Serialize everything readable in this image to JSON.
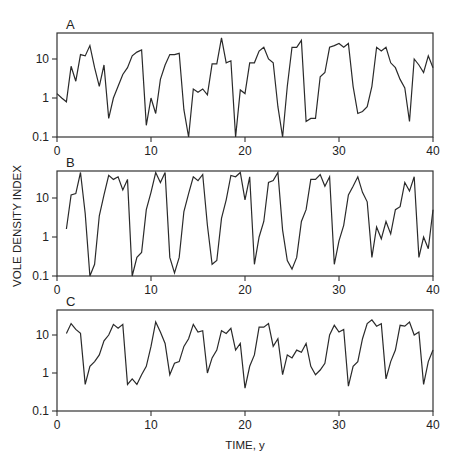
{
  "chart_data": {
    "type": "line",
    "ylabel": "VOLE DENSITY INDEX",
    "xlabel": "TIME, y",
    "xlim": [
      0,
      40
    ],
    "xticks": [
      0,
      10,
      20,
      30,
      40
    ],
    "yscale": "log",
    "ylim": [
      0.1,
      45
    ],
    "yticks": [
      0.1,
      1,
      10
    ],
    "ytick_labels": [
      "0.1",
      "1",
      "10"
    ],
    "grid": false,
    "panels": [
      {
        "label": "A",
        "x": [
          0,
          0.5,
          1,
          1.5,
          2,
          2.5,
          3,
          3.5,
          4,
          4.5,
          5,
          5.5,
          6,
          6.5,
          7,
          7.5,
          8,
          8.5,
          9,
          9.5,
          10,
          10.5,
          11,
          11.5,
          12,
          12.5,
          13,
          13.5,
          14,
          14.5,
          15,
          15.5,
          16,
          16.5,
          17,
          17.5,
          18,
          18.5,
          19,
          19.5,
          20,
          20.5,
          21,
          21.5,
          22,
          22.5,
          23,
          23.5,
          24,
          24.5,
          25,
          25.5,
          26,
          26.5,
          27,
          27.5,
          28,
          28.5,
          29,
          29.5,
          30,
          30.5,
          31,
          31.5,
          32,
          32.5,
          33,
          33.5,
          34,
          34.5,
          35,
          35.5,
          36,
          36.5,
          37,
          37.5,
          38,
          38.5,
          39,
          39.5,
          40
        ],
        "values": [
          1.3,
          1.0,
          0.8,
          6.5,
          2.7,
          13,
          12,
          22,
          6,
          2,
          7,
          0.3,
          1.0,
          2,
          4,
          6,
          12,
          15,
          17,
          0.2,
          1.0,
          0.4,
          3,
          7,
          13,
          13,
          14,
          0.5,
          0.1,
          1.7,
          1.4,
          1.7,
          1.2,
          7.5,
          7.5,
          35,
          8,
          9,
          0.1,
          1.6,
          1.3,
          8,
          8,
          16,
          20,
          10,
          8,
          0.6,
          0.1,
          2,
          20,
          20,
          30,
          0.25,
          0.3,
          0.3,
          3.5,
          4.5,
          20,
          22,
          25,
          20,
          25,
          2,
          0.4,
          0.45,
          0.6,
          2,
          20,
          16,
          20,
          8,
          6,
          3,
          1.8,
          0.25,
          10,
          7,
          4.5,
          12,
          6
        ]
      },
      {
        "label": "B",
        "x": [
          1,
          1.5,
          2,
          2.5,
          3,
          3.5,
          4,
          4.5,
          5,
          5.5,
          6,
          6.5,
          7,
          7.5,
          8,
          8.5,
          9,
          9.5,
          10,
          10.5,
          11,
          11.5,
          12,
          12.5,
          13,
          13.5,
          14,
          14.5,
          15,
          15.5,
          16,
          16.5,
          17,
          17.5,
          18,
          18.5,
          19,
          19.5,
          20,
          20.5,
          21,
          21.5,
          22,
          22.5,
          23,
          23.5,
          24,
          24.5,
          25,
          25.5,
          26,
          26.5,
          27,
          27.5,
          28,
          28.5,
          29,
          29.5,
          30,
          30.5,
          31,
          31.5,
          32,
          32.5,
          33,
          33.5,
          34,
          34.5,
          35,
          35.5,
          36,
          36.5,
          37,
          37.5,
          38,
          38.5,
          39,
          39.5,
          40
        ],
        "values": [
          1.6,
          12,
          13,
          45,
          4,
          0.1,
          0.2,
          3.5,
          12,
          38,
          30,
          35,
          16,
          30,
          0.1,
          0.3,
          0.4,
          5,
          14,
          45,
          25,
          45,
          0.3,
          0.12,
          0.3,
          4.5,
          13,
          35,
          28,
          40,
          2,
          0.2,
          0.25,
          3,
          9,
          38,
          35,
          45,
          9,
          35,
          0.2,
          1.0,
          2.5,
          25,
          28,
          45,
          1.5,
          0.25,
          0.15,
          0.3,
          2.5,
          5,
          30,
          30,
          40,
          20,
          35,
          0.2,
          0.8,
          2,
          12,
          20,
          35,
          14,
          8,
          0.3,
          1.8,
          0.9,
          2.5,
          1.2,
          5,
          6,
          25,
          15,
          35,
          0.3,
          1.0,
          0.5,
          5,
          7,
          30
        ]
      },
      {
        "label": "C",
        "x": [
          1,
          1.5,
          2,
          2.5,
          3,
          3.5,
          4,
          4.5,
          5,
          5.5,
          6,
          6.5,
          7,
          7.5,
          8,
          8.5,
          9,
          9.5,
          10,
          10.5,
          11,
          11.5,
          12,
          12.5,
          13,
          13.5,
          14,
          14.5,
          15,
          15.5,
          16,
          16.5,
          17,
          17.5,
          18,
          18.5,
          19,
          19.5,
          20,
          20.5,
          21,
          21.5,
          22,
          22.5,
          23,
          23.5,
          24,
          24.5,
          25,
          25.5,
          26,
          26.5,
          27,
          27.5,
          28,
          28.5,
          29,
          29.5,
          30,
          30.5,
          31,
          31.5,
          32,
          32.5,
          33,
          33.5,
          34,
          34.5,
          35,
          35.5,
          36,
          36.5,
          37,
          37.5,
          38,
          38.5,
          39,
          39.5,
          40
        ],
        "values": [
          11,
          20,
          14,
          11,
          0.5,
          1.5,
          2,
          3,
          7,
          10,
          19,
          15,
          19,
          0.5,
          0.7,
          0.5,
          0.9,
          1.5,
          5,
          22,
          12,
          6,
          0.9,
          1.8,
          2,
          5,
          8,
          19,
          12,
          13,
          1.0,
          2.5,
          4,
          13,
          11,
          15,
          4,
          6,
          0.4,
          1.5,
          3,
          16,
          16,
          20,
          5,
          8,
          0.9,
          3,
          2.5,
          4,
          3.5,
          6,
          1.5,
          0.9,
          1.2,
          1.8,
          10,
          18,
          12,
          14,
          0.45,
          1.5,
          2,
          8,
          20,
          25,
          17,
          20,
          0.7,
          2,
          4,
          18,
          17,
          22,
          10,
          12,
          0.5,
          2,
          4,
          15
        ]
      }
    ]
  }
}
